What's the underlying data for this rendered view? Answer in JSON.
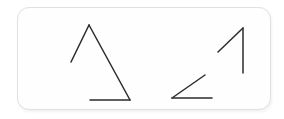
{
  "canvas": {
    "width": 284,
    "height": 119,
    "background_color": "#ffffff",
    "description": "Hand-drawn style line sketch on a white rounded card"
  },
  "card": {
    "name": "sketch-card",
    "x": 17,
    "y": 7,
    "width": 254,
    "height": 103,
    "corner_radius": 12,
    "fill_color": "#fefefe",
    "border_color": "#e0e0e0",
    "shadow_color": "rgba(0,0,0,0.055)"
  },
  "ink": {
    "stroke_color": "#2b2b2b",
    "stroke_width": 1.5,
    "line_cap": "round"
  },
  "figures": [
    {
      "name": "left-triangle-figure",
      "label": "open triangle",
      "strokes": [
        {
          "name": "left-triangle-left-edge",
          "points": "71,62 89,25"
        },
        {
          "name": "left-triangle-right-edge",
          "points": "89,25 130,100"
        },
        {
          "name": "left-triangle-baseline",
          "points": "90,100 130,100"
        }
      ]
    },
    {
      "name": "right-angle-figure",
      "label": "acute angle",
      "strokes": [
        {
          "name": "right-angle-diagonal-edge",
          "points": "172,98 205,75"
        },
        {
          "name": "right-angle-baseline",
          "points": "172,98 212,98"
        }
      ]
    },
    {
      "name": "right-caret-figure",
      "label": "caret with vertical stroke",
      "strokes": [
        {
          "name": "right-caret-diagonal-edge",
          "points": "218,52 243,28"
        },
        {
          "name": "right-caret-vertical-edge",
          "points": "243,28 243,73"
        }
      ]
    }
  ]
}
